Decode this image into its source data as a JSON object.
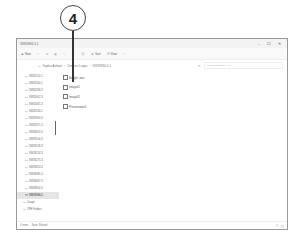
{
  "callout": {
    "number": "4"
  },
  "window": {
    "title": "SW33994-3-1",
    "controls": {
      "minimize": "–",
      "maximize": "☐",
      "close": "✕"
    }
  },
  "toolbar": {
    "new_label": "New",
    "sort_label": "Sort",
    "view_label": "View",
    "more_label": "···"
  },
  "address": {
    "back": "←",
    "forward": "→",
    "up": "↑",
    "refresh": "⟳",
    "path": [
      "Sophia Ashwin",
      "Contract Logos",
      "SW33994-3-1"
    ],
    "search_placeholder": "Search SW33994-3-1"
  },
  "navpane": {
    "items": [
      {
        "label": "SW32210-1",
        "level": 2
      },
      {
        "label": "SW32260-1",
        "level": 2
      },
      {
        "label": "SW32298-3",
        "level": 2
      },
      {
        "label": "SW32402-3",
        "level": 2
      },
      {
        "label": "SW32481-3",
        "level": 2
      },
      {
        "label": "SW32530-1",
        "level": 2
      },
      {
        "label": "SW32900-3",
        "level": 2
      },
      {
        "label": "SW32971-3",
        "level": 2
      },
      {
        "label": "SW33050-3",
        "level": 2
      },
      {
        "label": "SW33106-3",
        "level": 2
      },
      {
        "label": "SW33138-3",
        "level": 2
      },
      {
        "label": "SW33216-3",
        "level": 2
      },
      {
        "label": "SW33275-3",
        "level": 2
      },
      {
        "label": "SW33353-3",
        "level": 2
      },
      {
        "label": "SW33485-3",
        "level": 2
      },
      {
        "label": "SW33497-3",
        "level": 2
      },
      {
        "label": "SW33910-3",
        "level": 2
      },
      {
        "label": "SW33994-3",
        "level": 2,
        "selected": true
      },
      {
        "label": "Coupé",
        "level": 1
      },
      {
        "label": "CPE Folders",
        "level": 1
      }
    ]
  },
  "files": [
    {
      "name": "Bought .wav",
      "icon": "document-icon"
    },
    {
      "name": "Image01",
      "icon": "image-icon"
    },
    {
      "name": "Image02",
      "icon": "image-icon"
    },
    {
      "name": "Presentation1",
      "icon": "presentation-icon"
    }
  ],
  "status": {
    "item_count": "4 items",
    "state": "State: Shared"
  }
}
